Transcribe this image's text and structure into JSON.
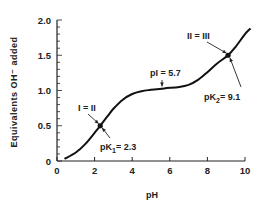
{
  "chart_data": {
    "type": "line",
    "title": "",
    "xlabel": "pH",
    "ylabel": "Equivalents OH⁻ added",
    "xlim": [
      0,
      10
    ],
    "ylim": [
      0,
      2.0
    ],
    "x_ticks": [
      "0",
      "2",
      "4",
      "6",
      "8",
      "10"
    ],
    "y_ticks": [
      "0",
      "0.5",
      "1.0",
      "1.5",
      "2.0"
    ],
    "grid": false,
    "series": [
      {
        "name": "titration curve",
        "points": [
          [
            0.4,
            0.03
          ],
          [
            1.0,
            0.12
          ],
          [
            1.5,
            0.24
          ],
          [
            2.0,
            0.4
          ],
          [
            2.3,
            0.5
          ],
          [
            2.7,
            0.64
          ],
          [
            3.0,
            0.74
          ],
          [
            3.5,
            0.87
          ],
          [
            4.0,
            0.95
          ],
          [
            4.5,
            0.99
          ],
          [
            5.0,
            1.01
          ],
          [
            5.7,
            1.03
          ],
          [
            6.5,
            1.05
          ],
          [
            7.0,
            1.08
          ],
          [
            7.5,
            1.15
          ],
          [
            8.0,
            1.26
          ],
          [
            8.5,
            1.38
          ],
          [
            9.1,
            1.5
          ],
          [
            9.5,
            1.62
          ],
          [
            10.0,
            1.8
          ],
          [
            10.3,
            1.88
          ]
        ]
      }
    ],
    "annotations": [
      {
        "id": "eq1",
        "label": "I = II",
        "x": 2.3,
        "y": 0.5
      },
      {
        "id": "pk1",
        "label_main": "pK",
        "label_sub": "1",
        "label_tail": "= 2.3",
        "x": 2.3,
        "y": 0.5
      },
      {
        "id": "pi",
        "label": "pI = 5.7",
        "x": 5.7,
        "y": 1.03
      },
      {
        "id": "eq2",
        "label": "II = III",
        "x": 9.1,
        "y": 1.5
      },
      {
        "id": "pk2",
        "label_main": "pK",
        "label_sub": "2",
        "label_tail": "= 9.1",
        "x": 9.1,
        "y": 1.5
      }
    ]
  }
}
